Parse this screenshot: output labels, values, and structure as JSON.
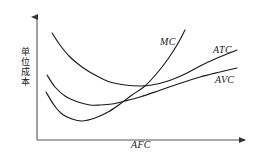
{
  "figure": {
    "background_color": "#ffffff",
    "stroke_color": "#1a1a1a",
    "axis_color": "#555555"
  },
  "axes": {
    "y_label": "单位成本",
    "x_label": "AFC",
    "y_arrow": "arrow-up",
    "x_arrow": "arrow-right"
  },
  "labels": {
    "mc": "MC",
    "atc": "ATC",
    "avc": "AVC"
  },
  "chart_data": {
    "type": "line",
    "title": "",
    "xlabel": "AFC",
    "ylabel": "单位成本",
    "grid": false,
    "legend": "inline-curve-labels",
    "xlim": [
      37,
      247
    ],
    "ylim": [
      140,
      20
    ],
    "note": "Coordinates are in screenshot pixel space; y increases downward. Classic short-run cost curves: MC cuts AVC and ATC at their minima.",
    "series": [
      {
        "name": "ATC",
        "label": "ATC",
        "color": "#1a1a1a",
        "points": [
          [
            52,
            33
          ],
          [
            60,
            45
          ],
          [
            70,
            57
          ],
          [
            82,
            67
          ],
          [
            95,
            75
          ],
          [
            110,
            82
          ],
          [
            125,
            85
          ],
          [
            140,
            86
          ],
          [
            152,
            85
          ],
          [
            168,
            81
          ],
          [
            185,
            74
          ],
          [
            200,
            66
          ],
          [
            215,
            59
          ],
          [
            237,
            50
          ]
        ]
      },
      {
        "name": "AVC",
        "label": "AVC",
        "color": "#1a1a1a",
        "points": [
          [
            47,
            75
          ],
          [
            55,
            87
          ],
          [
            65,
            96
          ],
          [
            78,
            102
          ],
          [
            90,
            105
          ],
          [
            100,
            105
          ],
          [
            112,
            104
          ],
          [
            125,
            101
          ],
          [
            140,
            97
          ],
          [
            158,
            91
          ],
          [
            178,
            84
          ],
          [
            200,
            77
          ],
          [
            220,
            72
          ],
          [
            237,
            68
          ]
        ]
      },
      {
        "name": "MC",
        "label": "MC",
        "color": "#1a1a1a",
        "points": [
          [
            46,
            92
          ],
          [
            54,
            105
          ],
          [
            62,
            114
          ],
          [
            72,
            119
          ],
          [
            82,
            121
          ],
          [
            95,
            118
          ],
          [
            108,
            112
          ],
          [
            120,
            104
          ],
          [
            132,
            95
          ],
          [
            145,
            86
          ],
          [
            158,
            72
          ],
          [
            168,
            59
          ],
          [
            177,
            45
          ],
          [
            185,
            30
          ]
        ]
      }
    ],
    "intersections": [
      {
        "curves": [
          "MC",
          "AVC"
        ],
        "x": 121,
        "y": 104,
        "meaning": "MC crosses AVC at AVC minimum"
      },
      {
        "curves": [
          "MC",
          "ATC"
        ],
        "x": 145,
        "y": 86,
        "meaning": "MC crosses ATC at ATC minimum"
      }
    ]
  }
}
